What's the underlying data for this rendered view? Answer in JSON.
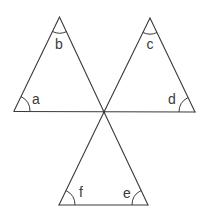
{
  "diagram": {
    "type": "geometry",
    "center_vertex": [
      104,
      112
    ],
    "triangles": [
      {
        "name": "left",
        "vertices": [
          [
            14,
            111
          ],
          [
            59.5,
            17
          ],
          [
            104,
            112
          ]
        ],
        "angles": [
          {
            "label": "a",
            "vertex": [
              14,
              111
            ],
            "label_pos": [
              36,
              99
            ]
          },
          {
            "label": "b",
            "vertex": [
              59.5,
              17
            ],
            "label_pos": [
              59,
              44
            ]
          }
        ]
      },
      {
        "name": "right",
        "vertices": [
          [
            104,
            112
          ],
          [
            150,
            18
          ],
          [
            195,
            112
          ]
        ],
        "angles": [
          {
            "label": "c",
            "vertex": [
              150,
              18
            ],
            "label_pos": [
              150,
              44
            ]
          },
          {
            "label": "d",
            "vertex": [
              195,
              112
            ],
            "label_pos": [
              172,
              99
            ]
          }
        ]
      },
      {
        "name": "bottom",
        "vertices": [
          [
            104,
            112
          ],
          [
            59,
            205
          ],
          [
            148,
            205
          ]
        ],
        "angles": [
          {
            "label": "f",
            "vertex": [
              59,
              205
            ],
            "label_pos": [
              81,
              192
            ]
          },
          {
            "label": "e",
            "vertex": [
              148,
              205
            ],
            "label_pos": [
              127,
              193
            ]
          }
        ]
      }
    ]
  },
  "labels": {
    "a": "a",
    "b": "b",
    "c": "c",
    "d": "d",
    "e": "e",
    "f": "f"
  }
}
